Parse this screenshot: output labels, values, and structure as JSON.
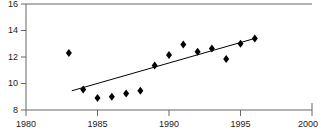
{
  "chart_data": {
    "type": "scatter",
    "title": "",
    "subtitle": "",
    "xlabel": "",
    "ylabel": "",
    "xlim": [
      1980,
      2000
    ],
    "ylim": [
      8,
      16
    ],
    "xticks": [
      1980,
      1985,
      1990,
      1995,
      2000
    ],
    "yticks": [
      8,
      10,
      12,
      14,
      16
    ],
    "xtick_labels": [
      "1980",
      "1985",
      "1990",
      "1995",
      "2000"
    ],
    "ytick_labels": [
      "8",
      "10",
      "12",
      "14",
      "16"
    ],
    "grid": false,
    "legend": null,
    "marker": "diamond",
    "marker_color": "#000000",
    "line_color": "#000000",
    "axis_color": "#555555",
    "x": [
      1983,
      1984,
      1985,
      1986,
      1987,
      1988,
      1989,
      1990,
      1991,
      1992,
      1993,
      1994,
      1995,
      1996
    ],
    "values": [
      12.3,
      9.55,
      8.9,
      9.0,
      9.25,
      9.45,
      11.35,
      12.15,
      12.95,
      12.4,
      12.65,
      11.85,
      13.0,
      13.4
    ],
    "series": [
      {
        "name": "observations",
        "type": "scatter",
        "x": [
          1983,
          1984,
          1985,
          1986,
          1987,
          1988,
          1989,
          1990,
          1991,
          1992,
          1993,
          1994,
          1995,
          1996
        ],
        "values": [
          12.3,
          9.55,
          8.9,
          9.0,
          9.25,
          9.45,
          11.35,
          12.15,
          12.95,
          12.4,
          12.65,
          11.85,
          13.0,
          13.4
        ]
      },
      {
        "name": "trend-line",
        "type": "line",
        "x": [
          1983.2,
          1996.0
        ],
        "values": [
          9.45,
          13.4
        ]
      }
    ],
    "annotations": []
  }
}
